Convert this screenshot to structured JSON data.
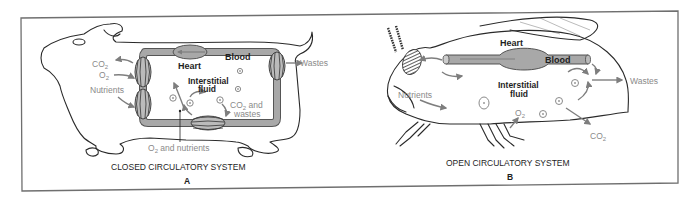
{
  "figure": {
    "panel_a": {
      "title": "CLOSED CIRCULATORY SYSTEM",
      "letter": "A",
      "organism": "mammal",
      "labels": {
        "heart": "Heart",
        "blood": "Blood",
        "interstitial_1": "Interstitial",
        "interstitial_2": "fluid",
        "co2": "CO",
        "co2_sub": "2",
        "o2": "O",
        "o2_sub": "2",
        "nutrients": "Nutrients",
        "wastes": "Wastes",
        "co2_and_1": "CO",
        "co2_and_sub": "2",
        "co2_and_2": " and",
        "wastes_2": "wastes",
        "o2_nutr_1": "O",
        "o2_nutr_sub": "2",
        "o2_nutr_2": " and nutrients"
      }
    },
    "panel_b": {
      "title": "OPEN CIRCULATORY SYSTEM",
      "letter": "B",
      "organism": "insect",
      "labels": {
        "heart": "Heart",
        "blood": "Blood",
        "interstitial_1": "Interstitial",
        "interstitial_2": "fluid",
        "nutrients": "Nutrients",
        "wastes": "Wastes",
        "o2": "O",
        "o2_sub": "2",
        "co2": "CO",
        "co2_sub": "2"
      }
    },
    "colors": {
      "ink": "#1e1e1e",
      "label_gray": "#8a8a8a",
      "vessel_fill": "#a8a8a8",
      "frame": "#6f6f6f",
      "background": "#ffffff"
    }
  }
}
